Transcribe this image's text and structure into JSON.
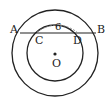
{
  "diagram": {
    "type": "concentric-circles-with-chord",
    "center": {
      "label": "O",
      "x": 55,
      "y": 53
    },
    "outer_circle": {
      "r": 43
    },
    "inner_circle": {
      "r": 28
    },
    "chord": {
      "y": 33,
      "x1": 20,
      "x2": 96
    },
    "points": {
      "A": {
        "label": "A",
        "x": 20,
        "y": 33
      },
      "B": {
        "label": "B",
        "x": 96,
        "y": 33
      },
      "C": {
        "label": "C",
        "x": 36,
        "y": 33
      },
      "D": {
        "label": "D",
        "x": 76,
        "y": 33
      }
    },
    "measurement": {
      "segment": "CD",
      "value": "6"
    },
    "colors": {
      "stroke": "#222222",
      "dashed": "#888888",
      "background": "#ffffff"
    }
  }
}
